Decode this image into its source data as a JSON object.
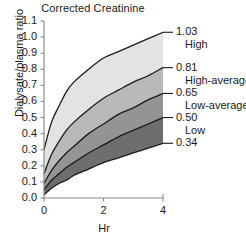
{
  "chart_data": {
    "type": "area",
    "title": "Corrected Creatinine",
    "xlabel": "Hr",
    "ylabel": "Dialysate/plasma ratio",
    "xlim": [
      0,
      4
    ],
    "ylim": [
      0.0,
      1.1
    ],
    "grid": false,
    "legend_position": "right-of-axes-inline",
    "x_ticks": [
      "0",
      "2",
      "4"
    ],
    "x_tick_values": [
      0,
      2,
      4
    ],
    "y_ticks": [
      "0.0",
      "0.1",
      "0.2",
      "0.3",
      "0.4",
      "0.5",
      "0.6",
      "0.7",
      "0.8",
      "0.9",
      "1.0",
      "1.1"
    ],
    "y_tick_values": [
      0.0,
      0.1,
      0.2,
      0.3,
      0.4,
      0.5,
      0.6,
      0.7,
      0.8,
      0.9,
      1.0,
      1.1
    ],
    "x": [
      0,
      0.25,
      0.5,
      0.75,
      1,
      1.5,
      2,
      2.5,
      3,
      3.5,
      4
    ],
    "series": [
      {
        "name": "1.03",
        "category": "High",
        "endpoint_value": 1.03,
        "end_label": "1.03",
        "values": [
          0.3,
          0.47,
          0.57,
          0.66,
          0.72,
          0.8,
          0.87,
          0.91,
          0.95,
          0.99,
          1.03
        ]
      },
      {
        "name": "0.81",
        "category": "High-average",
        "endpoint_value": 0.81,
        "end_label": "0.81",
        "values": [
          0.15,
          0.27,
          0.35,
          0.42,
          0.47,
          0.55,
          0.62,
          0.67,
          0.72,
          0.76,
          0.81
        ]
      },
      {
        "name": "0.65",
        "category": "Low-average",
        "endpoint_value": 0.65,
        "end_label": "0.65",
        "values": [
          0.09,
          0.17,
          0.23,
          0.28,
          0.32,
          0.4,
          0.46,
          0.52,
          0.56,
          0.61,
          0.65
        ]
      },
      {
        "name": "0.50",
        "category": "Low",
        "endpoint_value": 0.5,
        "end_label": "0.50",
        "values": [
          0.05,
          0.11,
          0.15,
          0.19,
          0.22,
          0.28,
          0.33,
          0.38,
          0.42,
          0.46,
          0.5
        ]
      },
      {
        "name": "0.34",
        "category": "",
        "endpoint_value": 0.34,
        "end_label": "0.34",
        "values": [
          0.02,
          0.06,
          0.09,
          0.11,
          0.14,
          0.18,
          0.22,
          0.25,
          0.28,
          0.31,
          0.34
        ]
      }
    ],
    "bands": [
      {
        "name": "high-band",
        "upper": "1.03",
        "lower": "0.81",
        "fill": "#e3e3e3"
      },
      {
        "name": "high-average-band",
        "upper": "0.81",
        "lower": "0.65",
        "fill": "#b9b9b9"
      },
      {
        "name": "low-average-band",
        "upper": "0.65",
        "lower": "0.50",
        "fill": "#949494"
      },
      {
        "name": "low-band",
        "upper": "0.50",
        "lower": "0.34",
        "fill": "#6e6e6e"
      }
    ],
    "value_labels": [
      "1.03",
      "0.81",
      "0.65",
      "0.50",
      "0.34"
    ],
    "category_labels": [
      "High",
      "High-average",
      "Low-average",
      "Low"
    ],
    "axis_color": "#8a8a8a",
    "line_color": "#1a1a1a",
    "background": "#ffffff"
  }
}
